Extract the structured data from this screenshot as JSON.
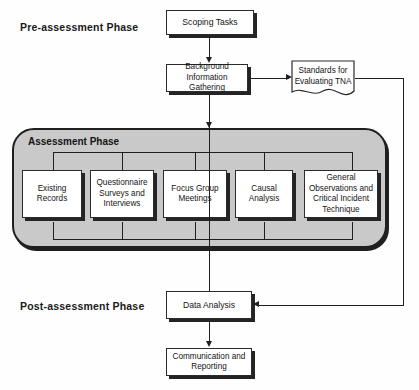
{
  "diagram": {
    "phases": {
      "pre": "Pre-assessment Phase",
      "assessment": "Assessment Phase",
      "post": "Post-assessment Phase"
    },
    "nodes": {
      "scoping_tasks": "Scoping Tasks",
      "background_info": "Background Information Gathering",
      "standards": "Standards for Evaluating TNA",
      "data_analysis": "Data Analysis",
      "communication": "Communication and Reporting"
    },
    "assessment_methods": [
      "Existing Records",
      "Questionnaire Surveys and Interviews",
      "Focus Group Meetings",
      "Causal Analysis",
      "General Observations and Critical Incident Technique"
    ],
    "colors": {
      "line": "#1f1f1f",
      "box_fill": "#ffffff",
      "container_fill": "#c9c9c9",
      "shadow": "#242424",
      "text": "#141414"
    }
  }
}
